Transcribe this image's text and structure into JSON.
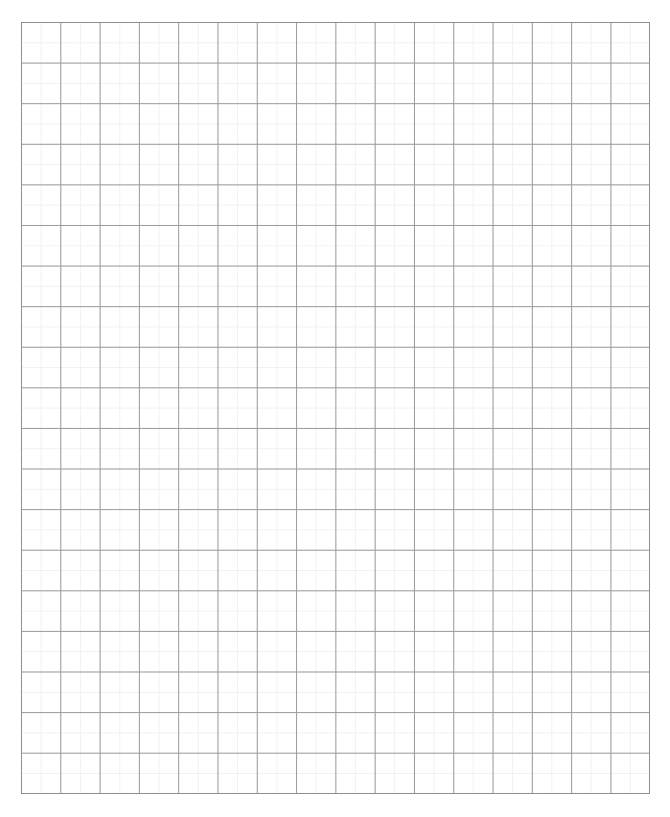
{
  "page": {
    "width": 670,
    "height": 817,
    "background_color": "#ffffff"
  },
  "grid": {
    "name": "graph-paper-grid",
    "x": 21,
    "y": 22,
    "width": 629,
    "height": 772,
    "major_columns": 16,
    "major_rows": 19,
    "minor_per_major": 2,
    "major_cell_width": 39.3,
    "major_cell_height": 40.6,
    "minor_cell_width": 19.65,
    "minor_cell_height": 20.3,
    "major_line_color": "#9a9a9a",
    "minor_line_color": "#f1f1f1",
    "border_color": "#8f8f8f",
    "major_line_width": 1,
    "minor_line_width": 1,
    "border_width": 1,
    "cell_fill_color": "#ffffff"
  },
  "chart_data": {
    "type": "table",
    "title": "",
    "xlabel": "",
    "ylabel": "",
    "categories": [],
    "values": [],
    "annotations": [],
    "legend": [],
    "grid": true
  }
}
